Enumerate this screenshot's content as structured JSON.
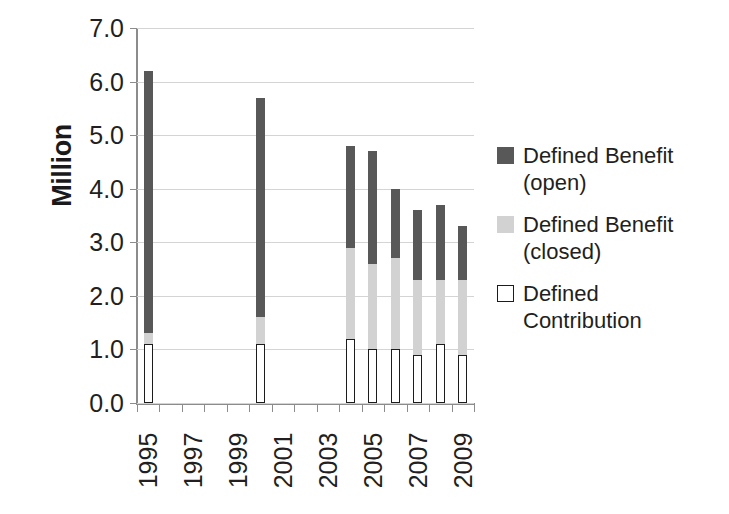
{
  "chart_data": {
    "type": "bar",
    "subtype": "stacked",
    "title": "",
    "xlabel": "",
    "ylabel": "Million",
    "ylim": [
      0.0,
      7.0
    ],
    "ytick_step": 1.0,
    "ytick_labels": [
      "0.0",
      "1.0",
      "2.0",
      "3.0",
      "4.0",
      "5.0",
      "6.0",
      "7.0"
    ],
    "grid": true,
    "legend_position": "right",
    "categories": [
      "1995",
      "1996",
      "1997",
      "1998",
      "1999",
      "2000",
      "2001",
      "2002",
      "2003",
      "2004",
      "2005",
      "2006",
      "2007",
      "2008",
      "2009"
    ],
    "xtick_labels_shown": [
      "1995",
      "1997",
      "1999",
      "2001",
      "2003",
      "2005",
      "2007",
      "2009"
    ],
    "series": [
      {
        "name": "Defined Contribution",
        "color": "#ffffff",
        "border_color": "#1c1c1c",
        "values": [
          1.1,
          null,
          null,
          null,
          null,
          1.1,
          null,
          null,
          null,
          1.2,
          1.0,
          1.0,
          0.9,
          1.1,
          0.9
        ]
      },
      {
        "name": "Defined Benefit (closed)",
        "color": "#d2d2d2",
        "values": [
          0.2,
          null,
          null,
          null,
          null,
          0.5,
          null,
          null,
          null,
          1.7,
          1.6,
          1.7,
          1.4,
          1.2,
          1.4
        ]
      },
      {
        "name": "Defined Benefit (open)",
        "color": "#585858",
        "values": [
          4.9,
          null,
          null,
          null,
          null,
          4.1,
          null,
          null,
          null,
          1.9,
          2.1,
          1.3,
          1.3,
          1.4,
          1.0
        ]
      }
    ],
    "totals": [
      6.2,
      null,
      null,
      null,
      null,
      5.7,
      null,
      null,
      null,
      4.8,
      4.7,
      4.0,
      3.6,
      3.7,
      3.3
    ],
    "bars": [
      {
        "year": "1995",
        "index": 0,
        "dc": 1.1,
        "closed_top": 1.3,
        "total": 6.2
      },
      {
        "year": "2000",
        "index": 5,
        "dc": 1.1,
        "closed_top": 1.6,
        "total": 5.7
      },
      {
        "year": "2004",
        "index": 9,
        "dc": 1.2,
        "closed_top": 2.9,
        "total": 4.8
      },
      {
        "year": "2005",
        "index": 10,
        "dc": 1.0,
        "closed_top": 2.6,
        "total": 4.7
      },
      {
        "year": "2006",
        "index": 11,
        "dc": 1.0,
        "closed_top": 2.7,
        "total": 4.0
      },
      {
        "year": "2007",
        "index": 12,
        "dc": 0.9,
        "closed_top": 2.3,
        "total": 3.6
      },
      {
        "year": "2008",
        "index": 13,
        "dc": 1.1,
        "closed_top": 2.3,
        "total": 3.7
      },
      {
        "year": "2009",
        "index": 14,
        "dc": 0.9,
        "closed_top": 2.3,
        "total": 3.3
      }
    ]
  },
  "axis": {
    "y_title": "Million"
  },
  "legend": {
    "items": [
      {
        "swatch": "sw-open",
        "line1": "Defined Benefit",
        "line2": "(open)"
      },
      {
        "swatch": "sw-closed",
        "line1": "Defined Benefit",
        "line2": "(closed)"
      },
      {
        "swatch": "sw-dc",
        "line1": "Defined",
        "line2": "Contribution"
      }
    ]
  }
}
